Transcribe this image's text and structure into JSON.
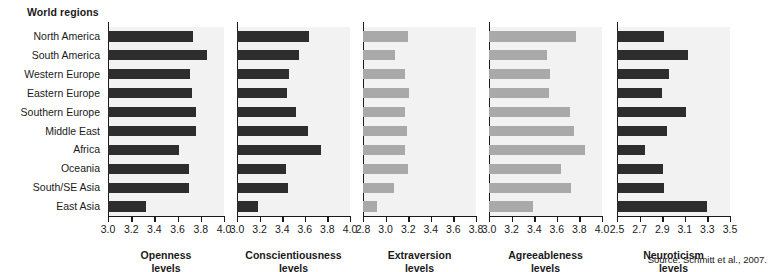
{
  "header": {
    "title": "World regions"
  },
  "source": {
    "text": "Source: Schmitt et al., 2007."
  },
  "colors": {
    "dark_bar": "#2d2d2d",
    "light_bar": "#a9a9a9",
    "panel_background": "#f2f2f2",
    "axis": "#1a1a1a",
    "page_background": "#ffffff"
  },
  "chart_data": {
    "type": "bar",
    "orientation": "horizontal",
    "title": "World regions",
    "grid": false,
    "legend": null,
    "categories": [
      "North America",
      "South America",
      "Western Europe",
      "Eastern Europe",
      "Southern Europe",
      "Middle East",
      "Africa",
      "Oceania",
      "South/SE Asia",
      "East Asia"
    ],
    "panels": [
      {
        "name": "openness",
        "xlabel_line1": "Openness",
        "xlabel_line2": "levels",
        "xlim": [
          3.0,
          4.0
        ],
        "ticks": [
          3.0,
          3.2,
          3.4,
          3.6,
          3.8,
          4.0
        ],
        "tick_labels": [
          "3.0",
          "3.2",
          "3.4",
          "3.6",
          "3.8",
          "4.0"
        ],
        "bar_color": "#2d2d2d",
        "values": [
          3.73,
          3.85,
          3.71,
          3.72,
          3.76,
          3.76,
          3.61,
          3.7,
          3.7,
          3.33
        ]
      },
      {
        "name": "conscientiousness",
        "xlabel_line1": "Conscientiousness",
        "xlabel_line2": "levels",
        "xlim": [
          3.0,
          4.0
        ],
        "ticks": [
          3.0,
          3.2,
          3.4,
          3.6,
          3.8,
          4.0
        ],
        "tick_labels": [
          "3.0",
          "3.2",
          "3.4",
          "3.6",
          "3.8",
          "4.0"
        ],
        "bar_color": "#2d2d2d",
        "values": [
          3.64,
          3.55,
          3.46,
          3.44,
          3.52,
          3.63,
          3.74,
          3.43,
          3.45,
          3.19
        ]
      },
      {
        "name": "extraversion",
        "xlabel_line1": "Extraversion",
        "xlabel_line2": "levels",
        "xlim": [
          2.8,
          3.8
        ],
        "ticks": [
          2.8,
          3.0,
          3.2,
          3.4,
          3.6,
          3.8
        ],
        "tick_labels": [
          "2.8",
          "3.0",
          "3.2",
          "3.4",
          "3.6",
          "3.8"
        ],
        "bar_color": "#a9a9a9",
        "values": [
          3.2,
          3.08,
          3.17,
          3.21,
          3.17,
          3.19,
          3.17,
          3.2,
          3.07,
          2.92
        ]
      },
      {
        "name": "agreeableness",
        "xlabel_line1": "Agreeableness",
        "xlabel_line2": "levels",
        "xlim": [
          3.0,
          4.0
        ],
        "ticks": [
          3.0,
          3.2,
          3.4,
          3.6,
          3.8,
          4.0
        ],
        "tick_labels": [
          "3.0",
          "3.2",
          "3.4",
          "3.6",
          "3.8",
          "4.0"
        ],
        "bar_color": "#a9a9a9",
        "values": [
          3.77,
          3.51,
          3.54,
          3.53,
          3.72,
          3.75,
          3.85,
          3.64,
          3.73,
          3.39
        ]
      },
      {
        "name": "neuroticism",
        "xlabel_line1": "Neuroticism",
        "xlabel_line2": "levels",
        "xlim": [
          2.5,
          3.5
        ],
        "ticks": [
          2.5,
          2.7,
          2.9,
          3.1,
          3.3,
          3.5
        ],
        "tick_labels": [
          "2.5",
          "2.7",
          "2.9",
          "3.1",
          "3.3",
          "3.5"
        ],
        "bar_color": "#2d2d2d",
        "values": [
          2.92,
          3.13,
          2.96,
          2.9,
          3.11,
          2.94,
          2.75,
          2.91,
          2.92,
          3.3
        ]
      }
    ]
  }
}
